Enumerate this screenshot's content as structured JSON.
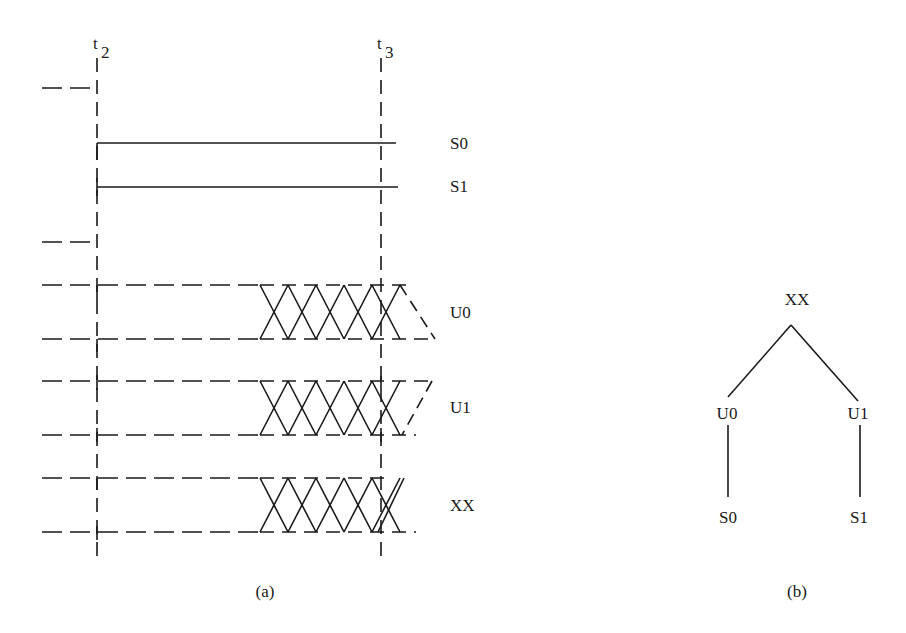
{
  "figure": {
    "panel_a": {
      "caption": "(a)",
      "time_markers": [
        {
          "label": "t",
          "subscript": "2"
        },
        {
          "label": "t",
          "subscript": "3"
        }
      ],
      "signals": [
        {
          "name": "S0",
          "style": "solid"
        },
        {
          "name": "S1",
          "style": "solid"
        },
        {
          "name": "U0",
          "style": "dashed-band-with-crosshatch"
        },
        {
          "name": "U1",
          "style": "dashed-band-with-crosshatch"
        },
        {
          "name": "XX",
          "style": "dashed-band-with-crosshatch"
        }
      ]
    },
    "panel_b": {
      "caption": "(b)",
      "tree": {
        "root": "XX",
        "left": "U0",
        "right": "U1",
        "left_leaf": "S0",
        "right_leaf": "S1"
      }
    }
  }
}
